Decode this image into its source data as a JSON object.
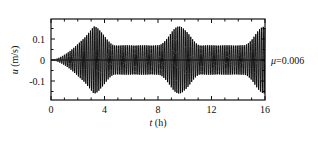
{
  "chart_data": {
    "type": "line",
    "title": "",
    "xlabel": "t (h)",
    "ylabel": "u (m/s)",
    "xlim": [
      0,
      16
    ],
    "ylim": [
      -0.19,
      0.19
    ],
    "xticks": [
      "0",
      "4",
      "8",
      "12",
      "16"
    ],
    "yticks": [
      "0.1",
      "0",
      "-0.1"
    ],
    "annotation": "μ=0.006",
    "grid": false,
    "series": [
      {
        "name": "u",
        "description": "oscillating velocity with beating envelope",
        "envelope_peaks_t": [
          3.2,
          6.6,
          9.8,
          13.0,
          15.3
        ],
        "envelope_peak_amplitude": 0.16,
        "envelope_min_amplitude": 0.07,
        "initial_amplitude": 0.0
      }
    ]
  }
}
